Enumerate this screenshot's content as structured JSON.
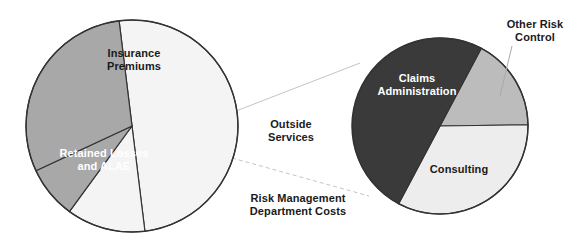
{
  "figure": {
    "background_color": "#ffffff",
    "outline_color": "#333333",
    "connector_color": "#b9b9b9"
  },
  "chart_data": [
    {
      "type": "pie",
      "name": "Total Cost of Risk",
      "title": "",
      "center": [
        132,
        126
      ],
      "radius": 106,
      "start_angle_deg": -97,
      "legend": "none",
      "categories": [
        "Insurance Premiums",
        "Outside Services",
        "Risk Management Department Costs",
        "Retained Losses and ALAE"
      ],
      "values": [
        50,
        12,
        8,
        30
      ],
      "colors": [
        "#f4f4f4",
        "#f4f4f4",
        "#a8a8a8",
        "#a8a8a8"
      ],
      "label_text_colors": [
        "#1a1a1a",
        "#1a1a1a",
        "#1a1a1a",
        "#ffffff"
      ],
      "labels_inside": [
        "Insurance\nPremiums",
        "",
        "",
        "Retained Losses\nand ALAE"
      ],
      "labels_outside": [
        "",
        "Outside\nServices",
        "Risk Management\nDepartment Costs",
        ""
      ]
    },
    {
      "type": "pie",
      "name": "Outside Services breakdown",
      "title": "",
      "center": [
        440,
        126
      ],
      "radius": 88,
      "start_angle_deg": -62,
      "legend": "none",
      "categories": [
        "Other Risk Control",
        "Consulting",
        "Claims Administration"
      ],
      "values": [
        17,
        33,
        50
      ],
      "colors": [
        "#bcbcbc",
        "#ededed",
        "#3a3a3a"
      ],
      "label_text_colors": [
        "#1a1a1a",
        "#1a1a1a",
        "#ffffff"
      ],
      "labels_inside": [
        "",
        "Consulting",
        "Claims\nAdministration"
      ],
      "labels_outside": [
        "Other Risk\nControl",
        "",
        ""
      ]
    }
  ],
  "labels": {
    "insurance_premiums": "Insurance\nPremiums",
    "retained_losses": "Retained Losses\nand ALAE",
    "outside_services": "Outside\nServices",
    "risk_management": "Risk Management\nDepartment Costs",
    "claims_administration": "Claims\nAdministration",
    "consulting": "Consulting",
    "other_risk_control": "Other Risk\nControl"
  }
}
